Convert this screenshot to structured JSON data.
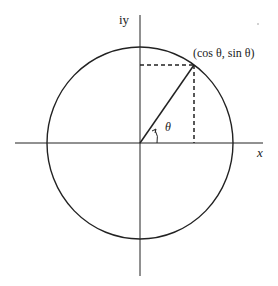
{
  "diagram": {
    "type": "unit-circle",
    "labels": {
      "y_axis": "iy",
      "x_axis": "x",
      "point": "(cos θ, sin θ)",
      "angle": "θ"
    },
    "geometry": {
      "center": [
        140,
        143
      ],
      "radius": 94,
      "point": [
        194,
        65
      ]
    },
    "colors": {
      "stroke": "#222222",
      "background": "#ffffff"
    }
  }
}
